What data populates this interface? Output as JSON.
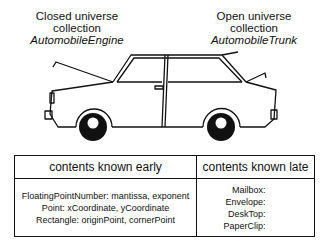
{
  "labels": {
    "closed": {
      "line1": "Closed universe",
      "line2": "collection",
      "class_name": "AutomobileEngine"
    },
    "open": {
      "line1": "Open universe",
      "line2": "collection",
      "class_name": "AutomobileTrunk"
    }
  },
  "illustration": {
    "subject": "car-with-open-hood-and-trunk",
    "color": "#111111"
  },
  "table": {
    "headers": [
      "contents known early",
      "contents known late"
    ],
    "early_rows": [
      "FloatingPointNumber: mantissa, exponent",
      "Point: xCoordinate, yCoordinate",
      "Rectangle: originPoint, cornerPoint"
    ],
    "late_rows": [
      "Mailbox:",
      "Envelope:",
      "DeskTop:",
      "PaperClip:"
    ]
  }
}
